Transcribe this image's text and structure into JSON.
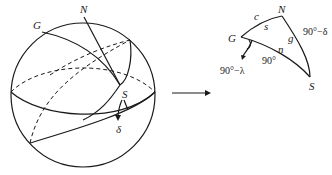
{
  "figure": {
    "sphere": {
      "labels": {
        "G": "G",
        "N": "N",
        "S": "S",
        "delta": "δ"
      }
    },
    "arrow": {
      "direction": "right"
    },
    "triangle": {
      "vertices": {
        "G": "G",
        "N": "N",
        "S": "S"
      },
      "sides": {
        "GN": "c",
        "NS": "90°−δ",
        "GS": "90°"
      },
      "angles": {
        "G_inner": "s",
        "N_inner": "g",
        "S_inner": "n"
      },
      "angle_annotation": "90°−λ"
    }
  }
}
